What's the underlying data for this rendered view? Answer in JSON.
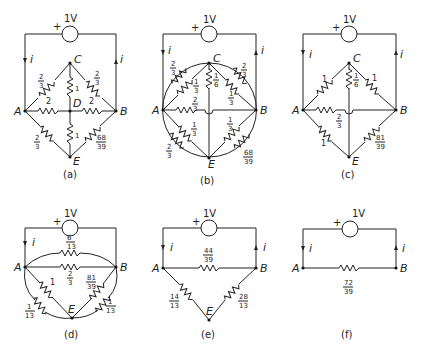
{
  "figure": {
    "panels": [
      {
        "id": "a",
        "caption": "(a)",
        "source": {
          "label": "1V",
          "polarity": "+"
        },
        "current_labels": [
          "i",
          "i"
        ],
        "nodes": [
          "A",
          "B",
          "C",
          "D",
          "E"
        ],
        "resistors": [
          {
            "from": "A",
            "to": "C",
            "num": "2",
            "den": "3"
          },
          {
            "from": "C",
            "to": "B",
            "num": "2",
            "den": "3"
          },
          {
            "from": "C",
            "to": "D",
            "value": "1"
          },
          {
            "from": "A",
            "to": "D",
            "value": "2"
          },
          {
            "from": "D",
            "to": "B",
            "value": "2"
          },
          {
            "from": "D",
            "to": "E",
            "value": "1"
          },
          {
            "from": "A",
            "to": "E",
            "num": "2",
            "den": "3"
          },
          {
            "from": "E",
            "to": "B",
            "num": "68",
            "den": "39"
          }
        ]
      },
      {
        "id": "b",
        "caption": "(b)",
        "source": {
          "label": "1V",
          "polarity": "+"
        },
        "current_labels": [
          "i",
          "i"
        ],
        "nodes": [
          "A",
          "B",
          "C",
          "E"
        ],
        "resistors": [
          {
            "from": "A",
            "to": "C",
            "outer": true,
            "num": "2",
            "den": "3"
          },
          {
            "from": "A",
            "to": "C",
            "inner": true,
            "num": "1",
            "den": "3"
          },
          {
            "from": "C",
            "to": "B",
            "outer": true,
            "num": "2",
            "den": "3"
          },
          {
            "from": "C",
            "to": "B",
            "inner": true,
            "num": "1",
            "den": "3"
          },
          {
            "from": "C",
            "to": "E",
            "num": "1",
            "den": "6"
          },
          {
            "from": "A",
            "to": "B",
            "num": "2",
            "den": "3"
          },
          {
            "from": "A",
            "to": "E",
            "inner": true,
            "num": "1",
            "den": "3"
          },
          {
            "from": "A",
            "to": "E",
            "outer": true,
            "num": "2",
            "den": "3"
          },
          {
            "from": "E",
            "to": "B",
            "inner": true,
            "num": "1",
            "den": "3"
          },
          {
            "from": "E",
            "to": "B",
            "outer": true,
            "num": "68",
            "den": "39"
          }
        ]
      },
      {
        "id": "c",
        "caption": "(c)",
        "source": {
          "label": "1V",
          "polarity": "+"
        },
        "current_labels": [
          "i",
          "i"
        ],
        "nodes": [
          "A",
          "B",
          "C",
          "E"
        ],
        "resistors": [
          {
            "from": "A",
            "to": "C",
            "value": "1"
          },
          {
            "from": "C",
            "to": "B",
            "value": "1"
          },
          {
            "from": "C",
            "to": "E",
            "num": "1",
            "den": "6"
          },
          {
            "from": "A",
            "to": "B",
            "num": "2",
            "den": "3"
          },
          {
            "from": "A",
            "to": "E",
            "value": "1"
          },
          {
            "from": "E",
            "to": "B",
            "num": "81",
            "den": "39"
          }
        ]
      },
      {
        "id": "d",
        "caption": "(d)",
        "source": {
          "label": "1V",
          "polarity": "+"
        },
        "current_labels": [
          "i"
        ],
        "nodes": [
          "A",
          "B",
          "E"
        ],
        "resistors": [
          {
            "from": "A",
            "to": "B",
            "upper": true,
            "num": "6",
            "den": "13"
          },
          {
            "from": "A",
            "to": "B",
            "num": "2",
            "den": "3"
          },
          {
            "from": "A",
            "to": "E",
            "value": "1"
          },
          {
            "from": "A",
            "to": "E",
            "outer": true,
            "num": "1",
            "den": "13"
          },
          {
            "from": "E",
            "to": "B",
            "num": "81",
            "den": "39"
          },
          {
            "from": "E",
            "to": "B",
            "outer": true,
            "num": "1",
            "den": "13"
          }
        ]
      },
      {
        "id": "e",
        "caption": "(e)",
        "source": {
          "label": "1V",
          "polarity": "+"
        },
        "current_labels": [
          "i",
          "i"
        ],
        "nodes": [
          "A",
          "B",
          "E"
        ],
        "resistors": [
          {
            "from": "A",
            "to": "B",
            "num": "44",
            "den": "39"
          },
          {
            "from": "A",
            "to": "E",
            "num": "14",
            "den": "13"
          },
          {
            "from": "E",
            "to": "B",
            "num": "28",
            "den": "13"
          }
        ]
      },
      {
        "id": "f",
        "caption": "(f)",
        "source": {
          "label": "1V",
          "polarity": "+"
        },
        "current_labels": [
          "i",
          "i"
        ],
        "nodes": [
          "A",
          "B"
        ],
        "resistors": [
          {
            "from": "A",
            "to": "B",
            "num": "72",
            "den": "39"
          }
        ]
      }
    ]
  }
}
